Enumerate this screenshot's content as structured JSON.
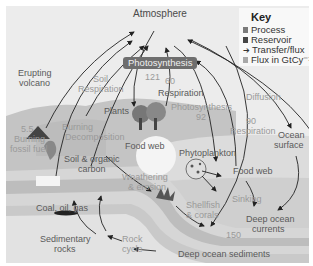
{
  "diagram": {
    "key": {
      "title": "Key",
      "items": [
        {
          "label": "Process",
          "swatch": "#7a7a7a",
          "type": "square"
        },
        {
          "label": "Reservoir",
          "swatch": "#444444",
          "type": "square"
        },
        {
          "label": "Transfer/flux",
          "swatch": "#333333",
          "type": "arrow"
        },
        {
          "label": "Flux in GtCy⁻¹",
          "swatch": "#a8a8a8",
          "type": "square"
        }
      ]
    },
    "labels": {
      "atmosphere": "Atmosphere",
      "photosynthesis_box": "Photosynthesis",
      "flux_121": "121",
      "flux_60": "60",
      "respiration_land": "Respiration",
      "erupting_volcano_1": "Erupting",
      "erupting_volcano_2": "volcano",
      "soil_respiration_1": "Soil",
      "soil_respiration_2": "Respiration",
      "plants": "Plants",
      "flux_5_5": "5.5",
      "burning_fossil_1": "Burning",
      "burning_fossil_2": "fossil fuel",
      "burning": "Burning",
      "decomposition": "Decomposition",
      "food_web_land": "Food web",
      "soil_organic_1": "Soil & organic",
      "soil_organic_2": "carbon",
      "photosynthesis_ocean": "Photosynthesis",
      "flux_92": "92",
      "flux_90": "90",
      "respiration_ocean": "Respiration",
      "diffusion": "Diffusion",
      "ocean_surface_1": "Ocean",
      "ocean_surface_2": "surface",
      "phytoplankton": "Phytoplankton",
      "food_web_ocean": "Food web",
      "weathering_1": "Weathering",
      "weathering_2": "& erosion",
      "coal_oil_gas": "Coal, oil, gas",
      "sinking": "Sinking",
      "shellfish_1": "Shellfish",
      "shellfish_2": "& corals",
      "deep_currents_1": "Deep ocean",
      "deep_currents_2": "currents",
      "flux_150": "150",
      "sedimentary_1": "Sedimentary",
      "sedimentary_2": "rocks",
      "rock_cycle_1": "Rock",
      "rock_cycle_2": "cycle",
      "deep_sediments": "Deep ocean sediments"
    }
  }
}
